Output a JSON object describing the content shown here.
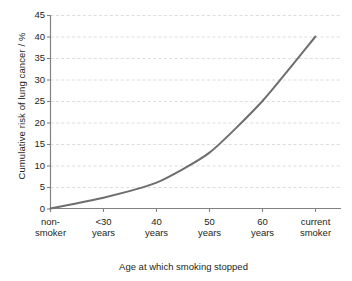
{
  "chart_data": {
    "type": "line",
    "title": "",
    "xlabel": "Age at which smoking stopped",
    "ylabel": "Cumulative risk of lung cancer / %",
    "categories": [
      "non-smoker",
      "<30 years",
      "40 years",
      "50 years",
      "60 years",
      "current smoker"
    ],
    "category_lines": [
      [
        "non-",
        "smoker"
      ],
      [
        "<30",
        "years"
      ],
      [
        "40",
        "years"
      ],
      [
        "50",
        "years"
      ],
      [
        "60",
        "years"
      ],
      [
        "current",
        "smoker"
      ]
    ],
    "values": [
      0,
      2.5,
      6,
      13,
      25,
      40
    ],
    "series": [
      {
        "name": "Cumulative risk of lung cancer",
        "values": [
          0,
          2.5,
          6,
          13,
          25,
          40
        ]
      }
    ],
    "ylim": [
      0,
      45
    ],
    "yticks": [
      0,
      5,
      10,
      15,
      20,
      25,
      30,
      35,
      40,
      45
    ],
    "ytick_labels": [
      "0",
      "5",
      "10",
      "15",
      "20",
      "25",
      "30",
      "35",
      "40",
      "45"
    ],
    "grid": "horizontal-dashed",
    "legend": "none",
    "line_color": "#6d6e70",
    "axis_color": "#808285",
    "grid_color": "#d9d0d6",
    "background_color": "#ffffff",
    "text_color": "#231f20"
  }
}
